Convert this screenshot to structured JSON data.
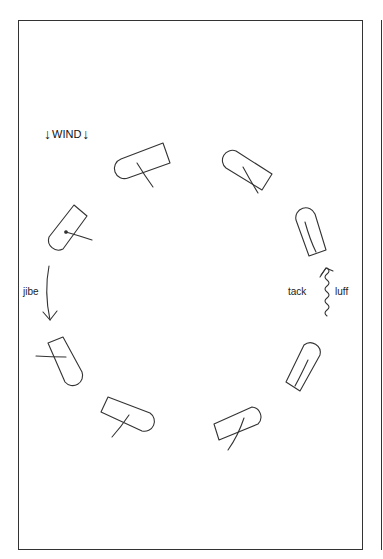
{
  "diagram": {
    "wind_label": "WIND",
    "wind_arrow": "↓",
    "labels": {
      "jibe": "jibe",
      "tack": "tack",
      "luff": "luff"
    },
    "boats": [
      {
        "id": "boat-1",
        "position": "top-left"
      },
      {
        "id": "boat-2",
        "position": "top-right"
      },
      {
        "id": "boat-3",
        "position": "right-upper"
      },
      {
        "id": "boat-4",
        "position": "left-upper"
      },
      {
        "id": "boat-5",
        "position": "left-lower"
      },
      {
        "id": "boat-6",
        "position": "bottom-left"
      },
      {
        "id": "boat-7",
        "position": "bottom-right"
      },
      {
        "id": "boat-8",
        "position": "right-lower"
      }
    ],
    "colors": {
      "stroke": "#333333",
      "background": "#ffffff"
    }
  }
}
